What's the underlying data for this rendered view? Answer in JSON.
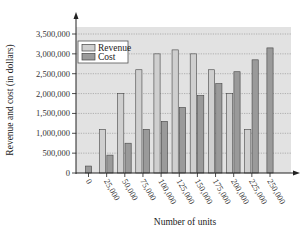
{
  "colors": {
    "plot_background": "#e2e2e2",
    "revenue": "#cfcfcf",
    "cost": "#9a9a9a",
    "bar_stroke": "#444444",
    "grid": "#9a9a9a",
    "axis": "#222222"
  },
  "chart_data": {
    "type": "bar",
    "title": "",
    "xlabel": "Number of units",
    "ylabel": "Revenue and cost (in dollars)",
    "categories": [
      "0",
      "25,000",
      "50,000",
      "75,000",
      "100,000",
      "125,000",
      "150,000",
      "175,000",
      "200,000",
      "225,000",
      "250,000"
    ],
    "series": [
      {
        "name": "Revenue",
        "values": [
          0,
          1100000,
          2000000,
          2600000,
          3000000,
          3100000,
          3000000,
          2600000,
          2000000,
          1100000,
          0
        ]
      },
      {
        "name": "Cost",
        "values": [
          175000,
          450000,
          750000,
          1100000,
          1300000,
          1650000,
          1950000,
          2250000,
          2550000,
          2850000,
          3150000
        ]
      }
    ],
    "yticks": [
      0,
      500000,
      1000000,
      1500000,
      2000000,
      2500000,
      3000000,
      3500000
    ],
    "ytick_labels": [
      "0",
      "500,000",
      "1,000,000",
      "1,500,000",
      "2,000,000",
      "2,500,000",
      "3,000,000",
      "3,500,000"
    ],
    "ylim": [
      0,
      3500000
    ],
    "grid": true,
    "legend_position": "upper left"
  }
}
